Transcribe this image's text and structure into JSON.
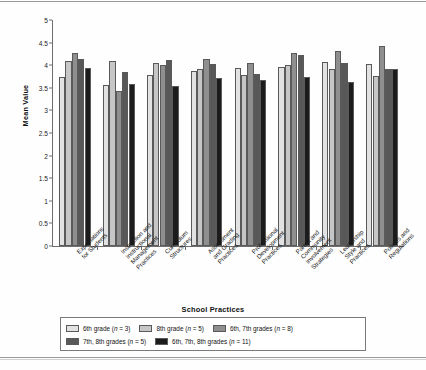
{
  "chart_data": {
    "type": "bar",
    "title": "",
    "xlabel": "School Practices",
    "ylabel": "Mean Value",
    "ylim": [
      0,
      5
    ],
    "ytick_values": [
      0,
      0.5,
      1,
      1.5,
      2,
      2.5,
      3,
      3.5,
      4,
      4.5,
      5
    ],
    "ytick_labels": [
      "0",
      "0.5",
      "1",
      "1.5",
      "2",
      "2.5",
      "3",
      "3.5",
      "4",
      "4.5",
      "5"
    ],
    "grid": false,
    "legend_position": "bottom",
    "categories": [
      "Expectations\nfor Students",
      "Instruction and\nInstructional\nManagement\nPractices",
      "Curriculum\nStructures",
      "Assessment\nand Grading\nPractices",
      "Professional\nDevelopment\nPractices",
      "Parent and\nCommunity\nInvolvement\nStrategies",
      "Leadership\nStyle and\nPractices",
      "Policies and\nRegulations"
    ],
    "series": [
      {
        "name": "6th grade (n = 3)",
        "label_main": "6th grade (",
        "label_italic": "n",
        "label_tail": " = 3)",
        "color": "#e2e2e2",
        "values": [
          3.75,
          3.57,
          3.79,
          3.87,
          3.93,
          3.97,
          4.07,
          4.02
        ]
      },
      {
        "name": "8th grade (n = 5)",
        "label_main": "8th grade (",
        "label_italic": "n",
        "label_tail": " = 5)",
        "color": "#c6c6c6",
        "values": [
          4.1,
          4.1,
          4.04,
          3.92,
          3.78,
          4.0,
          3.92,
          3.77
        ]
      },
      {
        "name": "6th, 7th grades (n = 8)",
        "label_main": "6th, 7th grades (",
        "label_italic": "n",
        "label_tail": " = 8)",
        "color": "#8f8f8f",
        "values": [
          4.28,
          3.44,
          4.01,
          4.14,
          4.05,
          4.26,
          4.31,
          4.42
        ]
      },
      {
        "name": "7th, 8th grades (n = 5)",
        "label_main": "7th, 8th grades (",
        "label_italic": "n",
        "label_tail": " = 5)",
        "color": "#585858",
        "values": [
          4.13,
          3.85,
          4.12,
          4.03,
          3.81,
          4.23,
          4.06,
          3.91
        ]
      },
      {
        "name": "6th, 7th, 8th grades (n = 11)",
        "label_main": "6th, 7th, 8th grades (",
        "label_italic": "n",
        "label_tail": " = 11)",
        "color": "#1c1c1c",
        "values": [
          3.93,
          3.59,
          3.55,
          3.71,
          3.67,
          3.74,
          3.63,
          3.91
        ]
      }
    ]
  }
}
